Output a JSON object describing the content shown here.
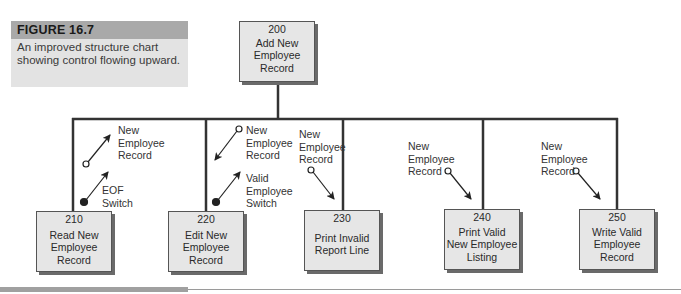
{
  "caption": {
    "figure_label": "FIGURE 16.7",
    "text": "An improved structure chart showing control flowing upward."
  },
  "modules": {
    "root": {
      "number": "200",
      "label": "Add New\nEmployee\nRecord"
    },
    "children": [
      {
        "number": "210",
        "label": "Read New\nEmployee\nRecord"
      },
      {
        "number": "220",
        "label": "Edit New\nEmployee\nRecord"
      },
      {
        "number": "230",
        "label": "Print Invalid\nReport Line"
      },
      {
        "number": "240",
        "label": "Print Valid\nNew Employee\nListing"
      },
      {
        "number": "250",
        "label": "Write Valid\nEmployee\nRecord"
      }
    ]
  },
  "couples": [
    {
      "module": "210",
      "type": "data",
      "direction": "up",
      "label": "New\nEmployee\nRecord"
    },
    {
      "module": "210",
      "type": "control",
      "direction": "up",
      "label": "EOF\nSwitch"
    },
    {
      "module": "220",
      "type": "data",
      "direction": "down",
      "label": "New\nEmployee\nRecord"
    },
    {
      "module": "220",
      "type": "control",
      "direction": "up",
      "label": "Valid\nEmployee\nSwitch"
    },
    {
      "module": "230",
      "type": "data",
      "direction": "down",
      "label": "New\nEmployee\nRecord"
    },
    {
      "module": "240",
      "type": "data",
      "direction": "down",
      "label": "New\nEmployee\nRecord"
    },
    {
      "module": "250",
      "type": "data",
      "direction": "down",
      "label": "New\nEmployee\nRecord"
    }
  ],
  "colors": {
    "box_fill": "#e6e6e6",
    "caption_header": "#a9a9a9",
    "caption_body": "#e3e3e3",
    "line": "#333333"
  }
}
